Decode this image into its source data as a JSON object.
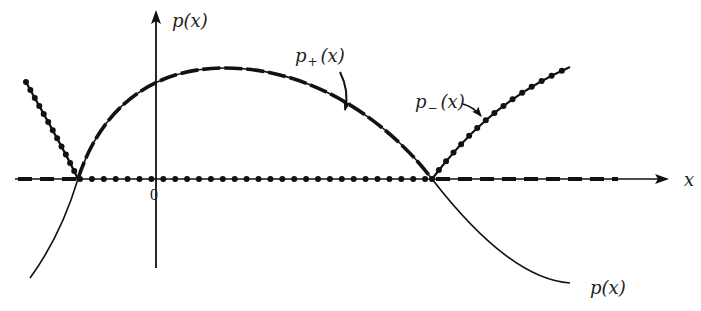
{
  "diagram": {
    "type": "function-plot",
    "axes": {
      "x_label": "x",
      "y_label": "p(x)",
      "origin_label": "0"
    },
    "curves": [
      {
        "name": "p(x)",
        "style": "solid thin",
        "label": "p(x)"
      },
      {
        "name": "p+(x)",
        "style": "dashed thick",
        "label": "p+(x)",
        "description": "equals p(x) where p(x) > 0, zero elsewhere"
      },
      {
        "name": "p-(x)",
        "style": "dotted (beaded) thick",
        "label": "p-(x)",
        "description": "equals -p(x) where p(x) < 0, zero elsewhere"
      }
    ],
    "labels": {
      "y_axis": "p(x)",
      "x_axis": "x",
      "origin": "0",
      "p_plus": {
        "base": "p",
        "sub": "+",
        "arg": "(x)"
      },
      "p_minus": {
        "base": "p",
        "sub": "−",
        "arg": "(x)"
      },
      "p_curve": "p(x)"
    },
    "colors": {
      "ink": "#111111",
      "background": "#ffffff"
    }
  }
}
